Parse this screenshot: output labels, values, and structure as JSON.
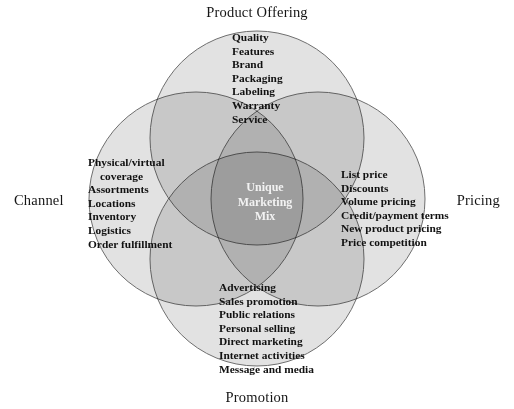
{
  "figure": {
    "type": "venn-diagram",
    "circle_count": 4,
    "center_label": {
      "line1": "Unique",
      "line2": "Marketing",
      "line3": "Mix"
    },
    "colors": {
      "circle_fill": "#e6e6e6",
      "circle_stroke": "#6e6e6e",
      "overlap_two": "#a9a9a9",
      "overlap_center": "#5a5a5a",
      "center_text": "#f2f2f2",
      "text": "#111111",
      "background": "#ffffff"
    }
  },
  "axis_labels": {
    "top": "Product Offering",
    "bottom": "Promotion",
    "left": "Channel",
    "right": "Pricing"
  },
  "sets": {
    "product_offering": {
      "title": "Product Offering",
      "items": [
        "Quality",
        "Features",
        "Brand",
        "Packaging",
        "Labeling",
        "Warranty",
        "Service"
      ]
    },
    "channel": {
      "title": "Channel",
      "items": [
        "Physical/virtual",
        "coverage",
        "Assortments",
        "Locations",
        "Inventory",
        "Logistics",
        "Order fulfillment"
      ]
    },
    "pricing": {
      "title": "Pricing",
      "items": [
        "List price",
        "Discounts",
        "Volume pricing",
        "Credit/payment terms",
        "New product pricing",
        "Price competition"
      ]
    },
    "promotion": {
      "title": "Promotion",
      "items": [
        "Advertising",
        "Sales promotion",
        "Public relations",
        "Personal selling",
        "Direct marketing",
        "Internet activities",
        "Message and media"
      ]
    }
  }
}
